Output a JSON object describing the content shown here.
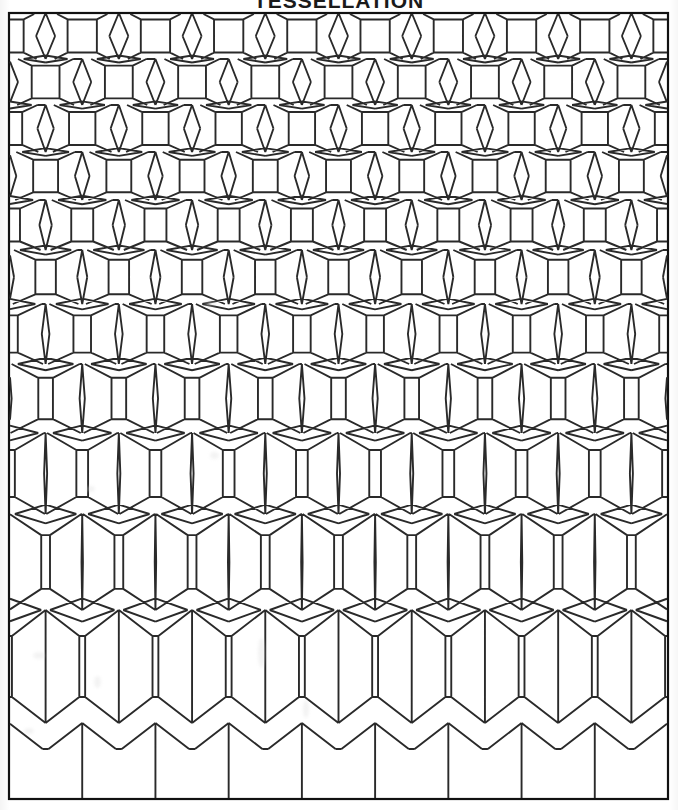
{
  "document": {
    "title": "TESSELLATION",
    "title_visible_fragment": "TESSELLATION",
    "title_clipped": "true",
    "page_background": "#ffffff",
    "ink_color": "#2a2a2a",
    "frame_color": "#111111"
  },
  "frame": {
    "x": 9,
    "y": 13,
    "width": 659,
    "height": 786,
    "stroke_width": 2.2
  },
  "plate": {
    "name": "tessellation-morph",
    "description": "Gradual transformation tiling: dense rhombus-and-square rhombille pattern at top morphs downward into large open hexagonal cells as the thin vertical rhombi shrink to zero width.",
    "columns": 9,
    "rows": 11,
    "line_color": "#2a2a2a",
    "line_width": 1.9,
    "fill": "none"
  },
  "chart_data": {
    "type": "line",
    "title": "TESSELLATION",
    "xlabel": "",
    "ylabel": "",
    "columns": 9,
    "rows": 11,
    "cell_width": 73.2,
    "left": 9,
    "right": 668,
    "top": 13,
    "bottom": 799,
    "row_heights": [
      46,
      46,
      47,
      48,
      50,
      54,
      60,
      69,
      81,
      96,
      113
    ],
    "row_tops": [
      13,
      59,
      105,
      152,
      200,
      250,
      304,
      364,
      433,
      514,
      610
    ],
    "row_bottoms": [
      59,
      105,
      152,
      200,
      250,
      304,
      364,
      433,
      514,
      610,
      723
    ],
    "rhombus_half_width": [
      9.5,
      9.0,
      8.2,
      7.3,
      6.2,
      5.0,
      3.8,
      2.6,
      1.5,
      0.7,
      0.0
    ],
    "waist_inset": [
      0.3,
      0.31,
      0.32,
      0.33,
      0.35,
      0.36,
      0.38,
      0.4,
      0.42,
      0.44,
      0.46
    ],
    "notch_depth": [
      0.14,
      0.145,
      0.15,
      0.16,
      0.17,
      0.18,
      0.19,
      0.2,
      0.21,
      0.22,
      0.23
    ],
    "grid": "off",
    "legend": "none"
  },
  "artifacts": {
    "blotches": [
      {
        "x": 86,
        "y": 486,
        "w": 9,
        "h": 6
      },
      {
        "x": 94,
        "y": 676,
        "w": 7,
        "h": 12
      },
      {
        "x": 258,
        "y": 638,
        "w": 7,
        "h": 30
      },
      {
        "x": 303,
        "y": 700,
        "w": 6,
        "h": 18
      },
      {
        "x": 205,
        "y": 300,
        "w": 11,
        "h": 7
      },
      {
        "x": 210,
        "y": 452,
        "w": 9,
        "h": 7
      },
      {
        "x": 33,
        "y": 652,
        "w": 12,
        "h": 7
      },
      {
        "x": 24,
        "y": 728,
        "w": 10,
        "h": 6
      }
    ]
  }
}
